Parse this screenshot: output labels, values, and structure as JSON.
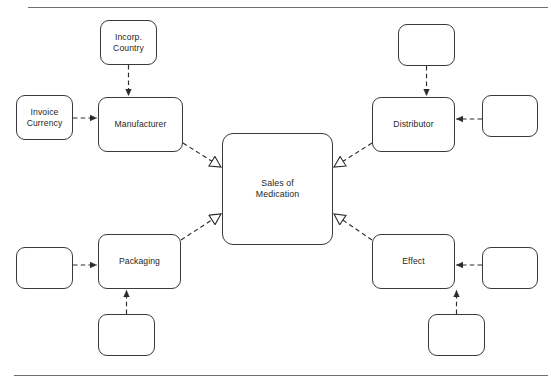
{
  "diagram": {
    "type": "uml-class-association-diagram",
    "title_text_visible": false,
    "canvas": {
      "width": 551,
      "height": 387,
      "background": "#ffffff"
    },
    "style": {
      "box_border_color": "#3a3a3e",
      "box_fill_color": "#ffffff",
      "connector_color": "#2b2b2e",
      "rule_color": "#6e6e72",
      "text_color": "#1f1f22"
    },
    "rules": [
      {
        "name": "top-rule",
        "x": 28,
        "y": 7,
        "width": 520
      },
      {
        "name": "bottom-rule",
        "x": 14,
        "y": 375,
        "width": 534
      }
    ],
    "nodes": [
      {
        "id": "incorp-country",
        "label": "Incorp.\nCountry",
        "x": 100,
        "y": 20,
        "w": 57,
        "h": 45,
        "font_size": 8.6,
        "empty": false
      },
      {
        "id": "invoice-currency",
        "label": "Invoice\nCurrency",
        "x": 16,
        "y": 95,
        "w": 57,
        "h": 45,
        "font_size": 8.6,
        "empty": false
      },
      {
        "id": "manufacturer",
        "label": "Manufacturer",
        "x": 98,
        "y": 97,
        "w": 85,
        "h": 55,
        "font_size": 8.6,
        "empty": false
      },
      {
        "id": "sales-of-medication",
        "label": "Sales of\nMedication",
        "x": 222,
        "y": 133,
        "w": 111,
        "h": 112,
        "font_size": 8.8,
        "empty": false
      },
      {
        "id": "distributor",
        "label": "Distributor",
        "x": 372,
        "y": 97,
        "w": 83,
        "h": 55,
        "font_size": 8.6,
        "empty": false
      },
      {
        "id": "packaging",
        "label": "Packaging",
        "x": 98,
        "y": 234,
        "w": 83,
        "h": 55,
        "font_size": 8.6,
        "empty": false
      },
      {
        "id": "effect",
        "label": "Effect",
        "x": 372,
        "y": 234,
        "w": 83,
        "h": 55,
        "font_size": 8.6,
        "empty": false
      },
      {
        "id": "empty-top-right",
        "label": "",
        "x": 398,
        "y": 24,
        "w": 57,
        "h": 42,
        "font_size": 8.6,
        "empty": true
      },
      {
        "id": "empty-right-middle",
        "label": "",
        "x": 482,
        "y": 95,
        "w": 56,
        "h": 42,
        "font_size": 8.6,
        "empty": true
      },
      {
        "id": "empty-left-lower",
        "label": "",
        "x": 16,
        "y": 247,
        "w": 57,
        "h": 42,
        "font_size": 8.6,
        "empty": true
      },
      {
        "id": "empty-below-packaging",
        "label": "",
        "x": 98,
        "y": 314,
        "w": 57,
        "h": 42,
        "font_size": 8.6,
        "empty": true
      },
      {
        "id": "empty-right-lower",
        "label": "",
        "x": 482,
        "y": 247,
        "w": 56,
        "h": 42,
        "font_size": 8.6,
        "empty": true
      },
      {
        "id": "empty-below-effect",
        "label": "",
        "x": 428,
        "y": 314,
        "w": 57,
        "h": 42,
        "font_size": 8.6,
        "empty": true
      }
    ],
    "connectors": [
      {
        "id": "incorp-country-to-manufacturer",
        "from": "incorp-country",
        "to": "manufacturer",
        "style": "dashed",
        "arrow": "filled-triangle",
        "points": "128.5,65 128.5,97"
      },
      {
        "id": "invoice-currency-to-manufacturer",
        "from": "invoice-currency",
        "to": "manufacturer",
        "style": "dashed",
        "arrow": "filled-triangle",
        "points": "73,118 98,118"
      },
      {
        "id": "manufacturer-to-sales",
        "from": "manufacturer",
        "to": "sales-of-medication",
        "style": "dashed",
        "arrow": "open-triangle",
        "points": "183,143 222,168"
      },
      {
        "id": "empty-top-right-to-distributor",
        "from": "empty-top-right",
        "to": "distributor",
        "style": "dashed",
        "arrow": "filled-triangle",
        "points": "426.5,66 426.5,97"
      },
      {
        "id": "empty-right-middle-to-distributor",
        "from": "empty-right-middle",
        "to": "distributor",
        "style": "dashed",
        "arrow": "filled-triangle",
        "points": "482,119 455,119"
      },
      {
        "id": "distributor-to-sales",
        "from": "distributor",
        "to": "sales-of-medication",
        "style": "dashed",
        "arrow": "open-triangle",
        "points": "372,143 333,168"
      },
      {
        "id": "empty-left-lower-to-packaging",
        "from": "empty-left-lower",
        "to": "packaging",
        "style": "dashed",
        "arrow": "filled-triangle",
        "points": "73,265 98,265"
      },
      {
        "id": "empty-below-packaging-to-packaging",
        "from": "empty-below-packaging",
        "to": "packaging",
        "style": "dashed",
        "arrow": "filled-triangle",
        "points": "126.5,314 126.5,289"
      },
      {
        "id": "packaging-to-sales",
        "from": "packaging",
        "to": "sales-of-medication",
        "style": "dashed",
        "arrow": "open-triangle",
        "points": "181,240 222,213"
      },
      {
        "id": "empty-right-lower-to-effect",
        "from": "empty-right-lower",
        "to": "effect",
        "style": "dashed",
        "arrow": "filled-triangle",
        "points": "482,265 455,265"
      },
      {
        "id": "empty-below-effect-to-effect",
        "from": "empty-below-effect",
        "to": "effect",
        "style": "dashed",
        "arrow": "filled-triangle",
        "points": "456.5,314 456.5,289"
      },
      {
        "id": "effect-to-sales",
        "from": "effect",
        "to": "sales-of-medication",
        "style": "dashed",
        "arrow": "open-triangle",
        "points": "372,240 333,213"
      }
    ]
  }
}
